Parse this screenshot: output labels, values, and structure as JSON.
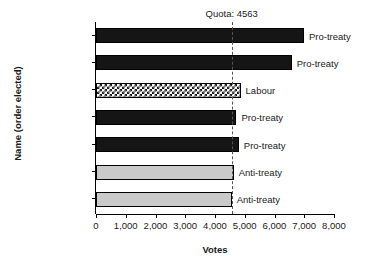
{
  "chart_data": {
    "type": "bar",
    "orientation": "horizontal",
    "title": "",
    "xlabel": "Votes",
    "ylabel": "Name (order elected)",
    "xlim": [
      0,
      8000
    ],
    "xticks": [
      0,
      1000,
      2000,
      3000,
      4000,
      5000,
      6000,
      7000,
      8000
    ],
    "xticklabels": [
      "0",
      "1,000",
      "2,000",
      "3,000",
      "4,000",
      "5,000",
      "6,000",
      "7,000",
      "8,000"
    ],
    "grid": false,
    "legend": "none",
    "categories": [
      "1. Hogan",
      "2. Ó Máille",
      "3. O’Connell",
      "4. Whelehan",
      "5. Nicholls",
      "6. Cusack",
      "7. Fahy"
    ],
    "values": [
      6990,
      6580,
      4860,
      4720,
      4800,
      4630,
      4560
    ],
    "bars": [
      {
        "category": "1. Hogan",
        "value": 6990,
        "annotation": "Pro-treaty",
        "fill": "black",
        "fill_color": "#151515"
      },
      {
        "category": "2. Ó Máille",
        "value": 6580,
        "annotation": "Pro-treaty",
        "fill": "black",
        "fill_color": "#151515"
      },
      {
        "category": "3. O’Connell",
        "value": 4860,
        "annotation": "Labour",
        "fill": "check",
        "fill_color": "#1a1a1a"
      },
      {
        "category": "4. Whelehan",
        "value": 4720,
        "annotation": "Pro-treaty",
        "fill": "black",
        "fill_color": "#151515"
      },
      {
        "category": "5. Nicholls",
        "value": 4800,
        "annotation": "Pro-treaty",
        "fill": "black",
        "fill_color": "#151515"
      },
      {
        "category": "6. Cusack",
        "value": 4630,
        "annotation": "Anti-treaty",
        "fill": "gray",
        "fill_color": "#c9c9c9"
      },
      {
        "category": "7. Fahy",
        "value": 4560,
        "annotation": "Anti-treaty",
        "fill": "gray",
        "fill_color": "#c9c9c9"
      }
    ],
    "reference_line": {
      "label": "Quota: 4563",
      "value": 4563,
      "style": "dashed",
      "color": "#555555"
    }
  }
}
